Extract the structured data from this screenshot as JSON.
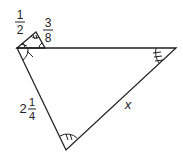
{
  "figure": {
    "type": "triangle-diagram",
    "labels": {
      "small_left_side": {
        "whole": "",
        "numerator": "1",
        "denominator": "2"
      },
      "small_right_side": {
        "whole": "",
        "numerator": "3",
        "denominator": "8"
      },
      "large_left_side": {
        "whole": "2",
        "numerator": "1",
        "denominator": "4"
      },
      "large_right_side": "x"
    },
    "angle_marks": {
      "single_tick": "left vertex angles",
      "double_tick": "bottom vertex angle",
      "triple_tick": "right vertex angle"
    },
    "colors": {
      "stroke": "#222222",
      "background": "#ffffff"
    }
  }
}
